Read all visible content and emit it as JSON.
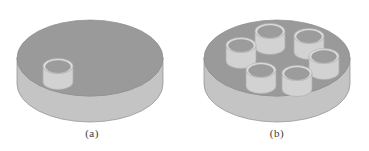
{
  "figure": {
    "name": "cylindrical-disk-specimens",
    "background_color": "#ffffff",
    "panels": [
      {
        "id": "a",
        "caption": "(a)",
        "description": "Isometric cylindrical disk with a single small cylindrical boss on its top surface",
        "disk": {
          "top_face_color": "#9a9a9a",
          "side_face_color": "#c4c4c4",
          "outline_color": "#8c8c8c",
          "center_x": 90,
          "center_y": 58,
          "radius_x": 73,
          "radius_y": 38,
          "thickness": 26
        },
        "cylinders": [
          {
            "index": 1,
            "center_x": 58,
            "center_y": 66,
            "radius_x": 15,
            "radius_y": 7.5,
            "height": 16,
            "top_face_color": "#9c9c9c",
            "wall_color": "#d2d2d2",
            "rim_color": "#dcdcdc"
          }
        ],
        "cylinder_count": 1
      },
      {
        "id": "b",
        "caption": "(b)",
        "description": "Isometric cylindrical disk with six small cylindrical bosses arranged in a circular array on its top surface",
        "disk": {
          "top_face_color": "#9a9a9a",
          "side_face_color": "#c4c4c4",
          "outline_color": "#8c8c8c",
          "center_x": 92,
          "center_y": 58,
          "radius_x": 73,
          "radius_y": 38,
          "thickness": 26
        },
        "cylinders": [
          {
            "index": 1,
            "center_x": 56,
            "center_y": 45,
            "radius_x": 15,
            "radius_y": 7.5,
            "height": 16,
            "top_face_color": "#9c9c9c",
            "wall_color": "#d2d2d2",
            "rim_color": "#dcdcdc"
          },
          {
            "index": 2,
            "center_x": 85,
            "center_y": 31,
            "radius_x": 15,
            "radius_y": 7.5,
            "height": 16,
            "top_face_color": "#9c9c9c",
            "wall_color": "#d2d2d2",
            "rim_color": "#dcdcdc"
          },
          {
            "index": 3,
            "center_x": 124,
            "center_y": 36,
            "radius_x": 15,
            "radius_y": 7.5,
            "height": 16,
            "top_face_color": "#9c9c9c",
            "wall_color": "#d2d2d2",
            "rim_color": "#dcdcdc"
          },
          {
            "index": 4,
            "center_x": 139,
            "center_y": 56,
            "radius_x": 15,
            "radius_y": 7.5,
            "height": 16,
            "top_face_color": "#9c9c9c",
            "wall_color": "#d2d2d2",
            "rim_color": "#dcdcdc"
          },
          {
            "index": 5,
            "center_x": 76,
            "center_y": 70,
            "radius_x": 15,
            "radius_y": 7.5,
            "height": 16,
            "top_face_color": "#9c9c9c",
            "wall_color": "#d2d2d2",
            "rim_color": "#dcdcdc"
          },
          {
            "index": 6,
            "center_x": 112,
            "center_y": 73,
            "radius_x": 15,
            "radius_y": 7.5,
            "height": 16,
            "top_face_color": "#9c9c9c",
            "wall_color": "#d2d2d2",
            "rim_color": "#dcdcdc"
          }
        ],
        "cylinder_count": 6
      }
    ]
  }
}
